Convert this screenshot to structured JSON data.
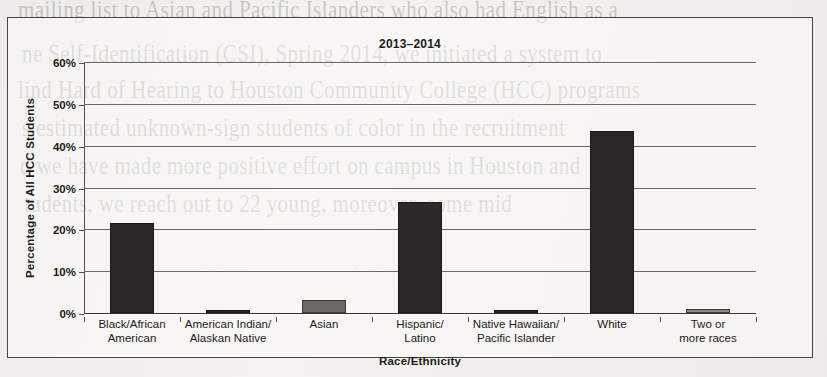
{
  "chart_data": {
    "type": "bar",
    "title": "2013–2014",
    "xlabel": "Race/Ethnicity",
    "ylabel": "Percentage of All HCC Students",
    "categories": [
      "Black/African American",
      "American Indian/ Alaskan Native",
      "Asian",
      "Hispanic/ Latino",
      "Native Hawaiian/ Pacific Islander",
      "White",
      "Two or more races"
    ],
    "category_lines": [
      [
        "Black/African",
        "American"
      ],
      [
        "American Indian/",
        "Alaskan Native"
      ],
      [
        "Asian",
        ""
      ],
      [
        "Hispanic/",
        "Latino"
      ],
      [
        "Native Hawaiian/",
        "Pacific Islander"
      ],
      [
        "White",
        ""
      ],
      [
        "Two or",
        "more races"
      ]
    ],
    "values": [
      21.5,
      0.7,
      3.0,
      26.6,
      0.3,
      43.5,
      0.9
    ],
    "ylim": [
      0,
      60
    ],
    "ytick_values": [
      0,
      10,
      20,
      30,
      40,
      50,
      60
    ],
    "ytick_labels": [
      "0%",
      "10%",
      "20%",
      "30%",
      "40%",
      "50%",
      "60%"
    ],
    "grid": true,
    "legend": "none",
    "bar_shades": [
      "dark",
      "dark",
      "mid",
      "dark",
      "dark",
      "dark",
      "light"
    ],
    "colors": {
      "bar_dark": "#2b2926",
      "bar_mid": "#6b6762",
      "bar_light": "#8b8781",
      "gridline": "#6f6963",
      "axis": "#3a3632",
      "text": "#1d1b19",
      "frame": "#4a4540",
      "page_background": "#f3f1ee"
    }
  },
  "background_text": {
    "lines": [
      "mailing list to Asian and Pacific Islanders who also had English as a",
      "ne Self-Identification (CSI), Spring 2014, we initiated a system to",
      "lind Hard of Hearing to Houston Community College (HCC) programs",
      "s estimated unknown-sign students of color in the recruitment",
      "d we have made more positive effort on campus in Houston and",
      "tudents, we reach out to 22 young, moreover, some mid"
    ]
  }
}
